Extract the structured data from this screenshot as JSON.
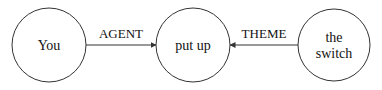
{
  "nodes": [
    {
      "id": "you",
      "label_lines": [
        "You"
      ],
      "cx": 49,
      "cy": 45,
      "r": 37
    },
    {
      "id": "put_up",
      "label_lines": [
        "put up"
      ],
      "cx": 193,
      "cy": 45,
      "r": 37
    },
    {
      "id": "the_switch",
      "label_lines": [
        "the",
        "switch"
      ],
      "cx": 334,
      "cy": 45,
      "r": 36
    }
  ],
  "edges": [
    {
      "from": "you",
      "to": "put_up",
      "label": "AGENT"
    },
    {
      "from": "the_switch",
      "to": "put_up",
      "label": "THEME"
    }
  ],
  "colors": {
    "stroke": "#333333",
    "text": "#111111",
    "background": "#ffffff"
  }
}
